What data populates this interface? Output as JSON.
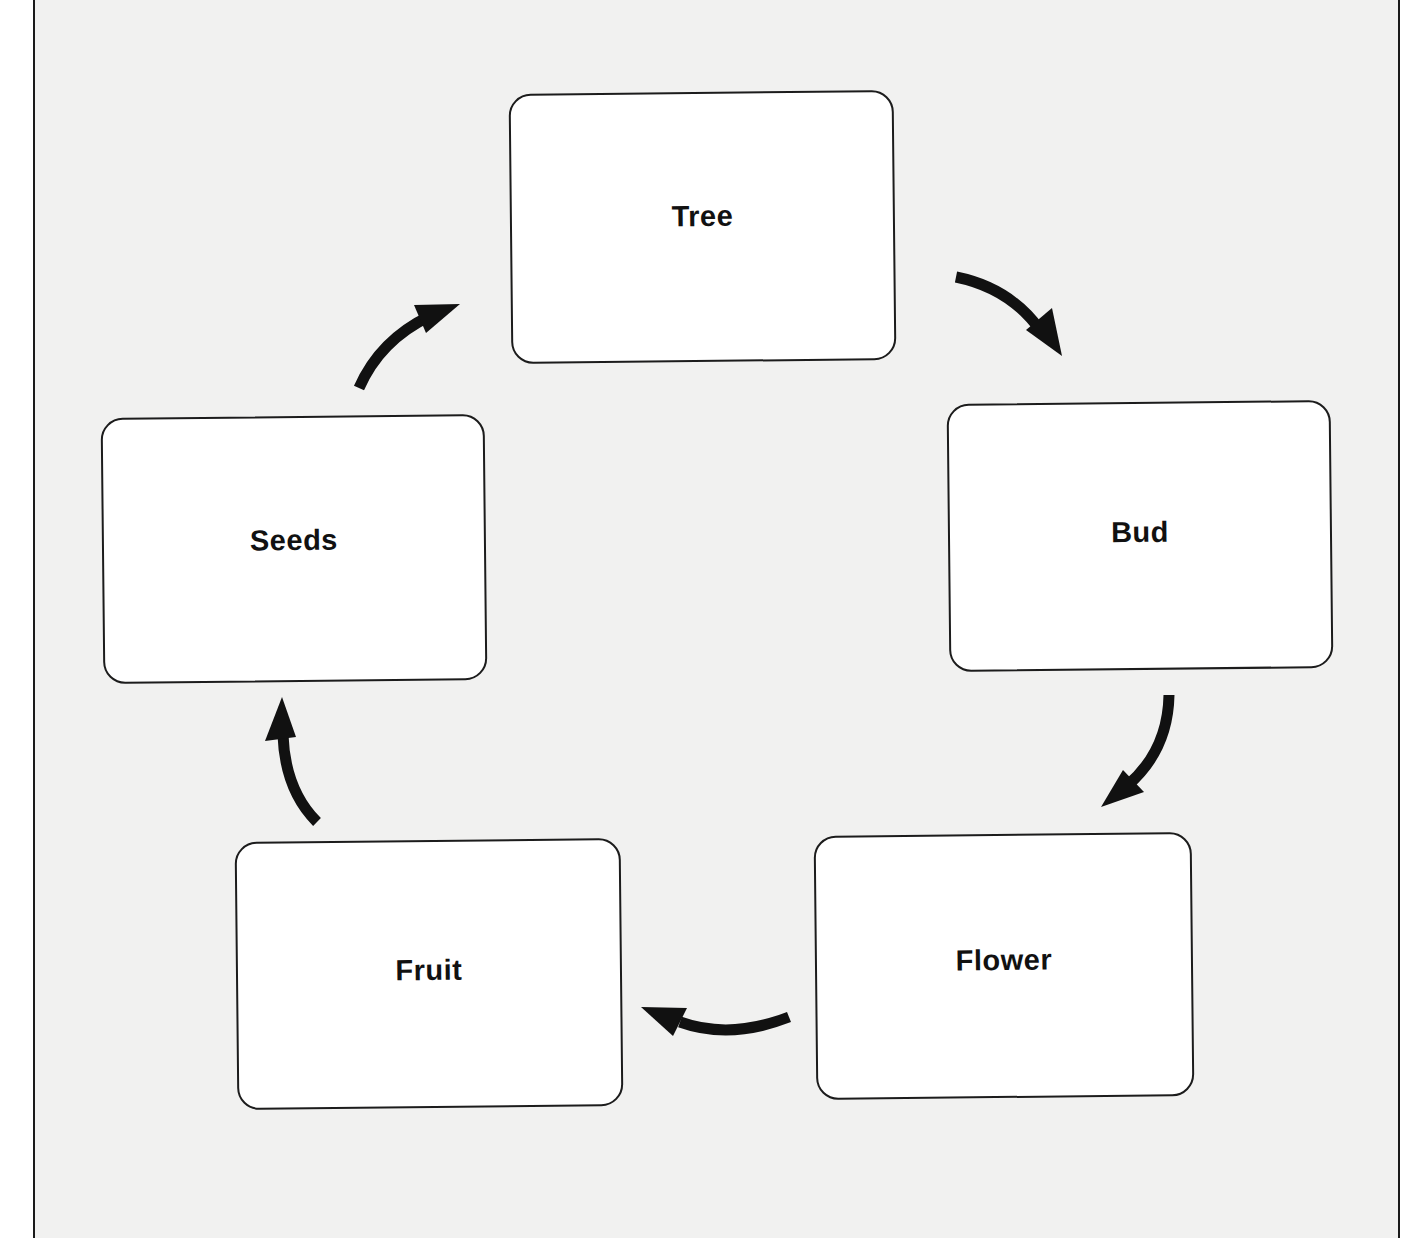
{
  "diagram": {
    "type": "cycle",
    "stages": [
      {
        "id": "tree",
        "label": "Tree"
      },
      {
        "id": "bud",
        "label": "Bud"
      },
      {
        "id": "flower",
        "label": "Flower"
      },
      {
        "id": "fruit",
        "label": "Fruit"
      },
      {
        "id": "seeds",
        "label": "Seeds"
      }
    ],
    "arrows": [
      {
        "from": "Tree",
        "to": "Bud"
      },
      {
        "from": "Bud",
        "to": "Flower"
      },
      {
        "from": "Flower",
        "to": "Fruit"
      },
      {
        "from": "Fruit",
        "to": "Seeds"
      },
      {
        "from": "Seeds",
        "to": "Tree"
      }
    ],
    "colors": {
      "paper": "#f1f1f0",
      "box_fill": "#ffffff",
      "stroke": "#1c1c1c",
      "arrow": "#111111"
    }
  }
}
